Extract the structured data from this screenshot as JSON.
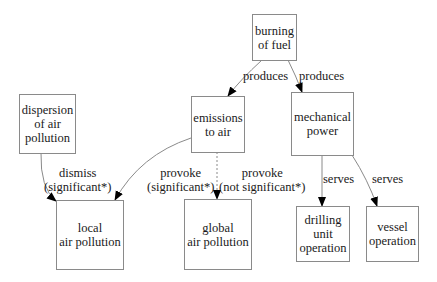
{
  "nodes": {
    "burning": {
      "label": "burning\nof fuel"
    },
    "dispersion": {
      "label": "dispersion\nof air\npollution"
    },
    "emissions": {
      "label": "emissions\nto air"
    },
    "mechanical": {
      "label": "mechanical\npower"
    },
    "local": {
      "label": "local\nair pollution"
    },
    "global": {
      "label": "global\nair pollution"
    },
    "drilling": {
      "label": "drilling\nunit\noperation"
    },
    "vessel": {
      "label": "vessel\noperation"
    }
  },
  "edges": {
    "burning_emissions": {
      "label": "produces"
    },
    "burning_mechanical": {
      "label": "produces"
    },
    "dispersion_local": {
      "label": "dismiss\n(significant*)"
    },
    "emissions_local": {
      "label": "provoke\n(significant*)"
    },
    "emissions_global": {
      "label": "provoke\n(not significant*)"
    },
    "mechanical_drilling": {
      "label": "serves"
    },
    "mechanical_vessel": {
      "label": "serves"
    }
  }
}
